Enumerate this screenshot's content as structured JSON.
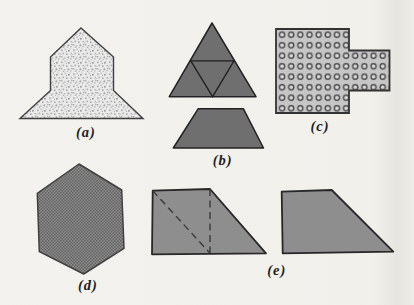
{
  "page": {
    "background_color": "#f2f0eb"
  },
  "figures": [
    {
      "key": "a",
      "label": "(a)",
      "shape": "arrow-house-heptagon",
      "texture": "random-stipple-dots",
      "fill": "#eaeaea",
      "dot_color": "#a8a8a8",
      "outline": "#3f3f3f"
    },
    {
      "key": "b",
      "label": "(b)",
      "shape": "triangle-subdivided-into-four-plus-trapezoid",
      "texture": "solid",
      "fill": "#6f6f6f",
      "outline": "#222222"
    },
    {
      "key": "c",
      "label": "(c)",
      "shape": "square-with-right-rectangular-tab",
      "texture": "grid-of-rings",
      "fill": "#c6c6c6",
      "ring_color": "#4b4b4b",
      "outline": "#333333"
    },
    {
      "key": "d",
      "label": "(d)",
      "shape": "hexagon-pointy-top",
      "texture": "fine-crosshatch-checker",
      "fill": "#8f8f8f",
      "check_color": "#616161",
      "outline": "#404040"
    },
    {
      "key": "e",
      "label": "(e)",
      "shape": "two-right-trapezoids-left-with-dashed-diagonal-and-vertical",
      "texture": "solid",
      "fill": "#8e8e8e",
      "dash_color": "#3a3a3a",
      "outline": "#272727"
    }
  ]
}
